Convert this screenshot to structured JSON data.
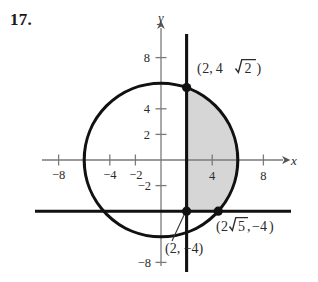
{
  "exercise": {
    "number_label": "17."
  },
  "figure": {
    "axes": {
      "x_axis_name": "x",
      "y_axis_name": "y",
      "x_ticks": [
        {
          "value": -8,
          "label": "−8"
        },
        {
          "value": -4,
          "label": "−4"
        },
        {
          "value": -2,
          "label": "−2"
        },
        {
          "value": 4,
          "label": "4"
        },
        {
          "value": 8,
          "label": "8"
        }
      ],
      "y_ticks": [
        {
          "value": 8,
          "label": "8"
        },
        {
          "value": 4,
          "label": "4"
        },
        {
          "value": 2,
          "label": "2"
        },
        {
          "value": -2,
          "label": "−2"
        },
        {
          "value": -8,
          "label": "−8"
        }
      ],
      "x_range": [
        -9.8,
        9.8
      ],
      "y_range": [
        -9.8,
        9.8
      ],
      "origin_px": [
        161,
        160
      ],
      "scale_px_per_unit": 12.8
    },
    "curves": [
      {
        "name": "circle",
        "type": "circle",
        "center": [
          0,
          0
        ],
        "radius": 6,
        "equation": "x^2 + y^2 = 36",
        "stroke": "#111111",
        "stroke_width": 3
      },
      {
        "name": "vertical-line",
        "type": "vertical-line",
        "x": 2,
        "equation": "x = 2",
        "stroke": "#111111",
        "stroke_width": 3
      },
      {
        "name": "horizontal-line",
        "type": "horizontal-line",
        "y": -4,
        "equation": "y = -4",
        "stroke": "#111111",
        "stroke_width": 3
      }
    ],
    "shaded_region": {
      "name": "shaded-region",
      "fill": "#d6d6d6",
      "description": "region inside circle with x >= 2 and y >= -4"
    },
    "points": [
      {
        "name": "upper-intersection",
        "coords": [
          2,
          5.657
        ],
        "label": "(2, 4√2)",
        "label_parts": {
          "open": "(",
          "x": "2,",
          "coef": "4",
          "radicand": "2",
          "close": ")"
        }
      },
      {
        "name": "lower-left-intersection",
        "coords": [
          2,
          -4
        ],
        "label": "(2, −4)",
        "label_parts": {
          "text": "(2, −4)"
        }
      },
      {
        "name": "lower-right-intersection",
        "coords": [
          4.472,
          -4
        ],
        "label": "(2√5, −4)",
        "label_parts": {
          "open": "(",
          "coef": "2",
          "radicand": "5",
          "comma": ",",
          "y": "−4",
          "close": ")"
        }
      }
    ],
    "colors": {
      "ink": "#111111",
      "axis": "#7a7a7a",
      "shade": "#d6d6d6",
      "text": "#2b2b2b"
    }
  }
}
